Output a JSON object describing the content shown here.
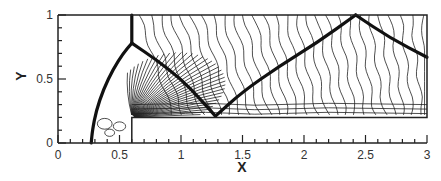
{
  "chart_data": {
    "type": "contour",
    "title": "",
    "xlabel": "X",
    "ylabel": "Y",
    "xlim": [
      0,
      3
    ],
    "ylim": [
      0,
      1
    ],
    "x_ticks": [
      0,
      0.5,
      1,
      1.5,
      2,
      2.5,
      3
    ],
    "x_tick_labels": [
      "0",
      "0.5",
      "1",
      "1.5",
      "2",
      "2.5",
      "3"
    ],
    "x_minor_step": 0.1,
    "y_ticks": [
      0,
      0.5,
      1
    ],
    "y_tick_labels": [
      "0",
      "0.5",
      "1"
    ],
    "y_minor_step": 0.1,
    "grid": false,
    "step": {
      "x_start": 0.6,
      "height": 0.2
    },
    "shocks": [
      {
        "name": "bow-shock",
        "points": [
          [
            0.27,
            0
          ],
          [
            0.28,
            0.1
          ],
          [
            0.31,
            0.25
          ],
          [
            0.37,
            0.42
          ],
          [
            0.45,
            0.58
          ],
          [
            0.53,
            0.7
          ],
          [
            0.6,
            0.78
          ]
        ]
      },
      {
        "name": "mach-stem",
        "points": [
          [
            0.6,
            0.78
          ],
          [
            0.6,
            1.0
          ]
        ]
      },
      {
        "name": "reflected-shock-1",
        "points": [
          [
            0.6,
            0.78
          ],
          [
            0.8,
            0.65
          ],
          [
            1.0,
            0.5
          ],
          [
            1.15,
            0.35
          ],
          [
            1.28,
            0.21
          ]
        ]
      },
      {
        "name": "reflected-shock-2",
        "points": [
          [
            1.28,
            0.21
          ],
          [
            1.5,
            0.4
          ],
          [
            1.8,
            0.6
          ],
          [
            2.1,
            0.78
          ],
          [
            2.42,
            1.0
          ]
        ]
      },
      {
        "name": "reflected-shock-3",
        "points": [
          [
            2.42,
            1.0
          ],
          [
            2.7,
            0.82
          ],
          [
            3.0,
            0.67
          ]
        ]
      }
    ],
    "fan_center": [
      0.6,
      0.2
    ]
  }
}
